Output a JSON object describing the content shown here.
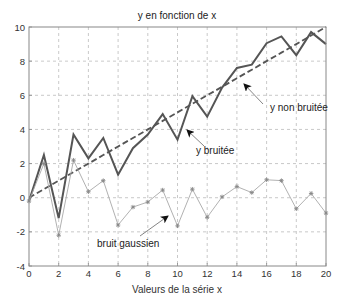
{
  "chart_data": {
    "type": "line",
    "title": "y en fonction de x",
    "xlabel": "Valeurs de la série x",
    "ylabel": "",
    "xlim": [
      0,
      20
    ],
    "ylim": [
      -4,
      10
    ],
    "xticks": [
      0,
      2,
      4,
      6,
      8,
      10,
      12,
      14,
      16,
      18,
      20
    ],
    "yticks": [
      -4,
      -2,
      0,
      2,
      4,
      6,
      8,
      10
    ],
    "grid": true,
    "legend": null,
    "x": [
      0,
      1,
      2,
      3,
      4,
      5,
      6,
      7,
      8,
      9,
      10,
      11,
      12,
      13,
      14,
      15,
      16,
      17,
      18,
      19,
      20
    ],
    "series": [
      {
        "name": "y non bruitée",
        "style": "dashed",
        "color": "#555555",
        "values": [
          0,
          0.5,
          1,
          1.5,
          2,
          2.5,
          3,
          3.5,
          4,
          4.5,
          5,
          5.5,
          6,
          6.5,
          7,
          7.5,
          8,
          8.5,
          9,
          9.5,
          10
        ]
      },
      {
        "name": "y bruitée",
        "style": "solid",
        "color": "#555555",
        "values": [
          -0.2,
          2.5,
          -1.2,
          3.7,
          2.3,
          3.5,
          1.35,
          2.9,
          3.7,
          4.9,
          3.4,
          5.95,
          4.75,
          6.45,
          7.6,
          7.8,
          9.05,
          9.45,
          8.35,
          9.7,
          9.0
        ]
      },
      {
        "name": "bruit gaussien",
        "style": "solid-markers",
        "color": "#a8a8a8",
        "marker": "*",
        "values": [
          -0.2,
          2.0,
          -2.2,
          2.2,
          0.35,
          1.0,
          -1.6,
          -0.55,
          -0.25,
          0.45,
          -1.65,
          0.5,
          -1.15,
          0.05,
          0.65,
          0.3,
          1.05,
          1.0,
          -0.65,
          0.25,
          -0.9
        ]
      }
    ],
    "annotations": [
      {
        "text": "y non bruitée",
        "text_px": [
          270,
          111
        ],
        "arrow_from_px": [
          263,
          104
        ],
        "arrow_to_px": [
          244,
          84
        ]
      },
      {
        "text": "y bruitée",
        "text_px": [
          196,
          154
        ],
        "arrow_from_px": [
          204,
          146
        ],
        "arrow_to_px": [
          187,
          130
        ]
      },
      {
        "text": "bruit gaussien",
        "text_px": [
          97,
          247
        ],
        "arrow_from_px": [
          140,
          236
        ],
        "arrow_to_px": [
          168,
          216
        ]
      }
    ]
  }
}
